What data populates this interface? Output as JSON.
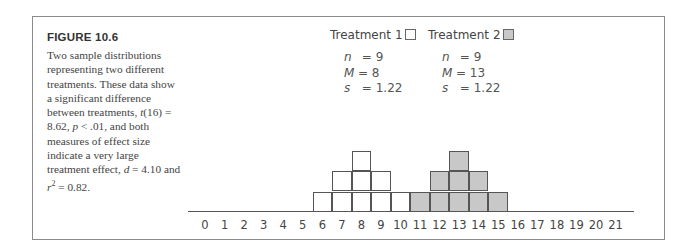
{
  "figure": {
    "title": "FIGURE 10.6",
    "caption_parts": {
      "p1": "Two sample distributions representing two different treatments. These data show a significant difference between treatments, ",
      "t_stat": "t",
      "p2": "(16) = 8.62, ",
      "p_sym": "p",
      "p3": " < .01, and both measures of effect size indicate a very large treatment effect, ",
      "d_sym": "d",
      "p4": " = 4.10 and ",
      "r_sym": "r",
      "r_sup": "2",
      "p5": " = 0.82."
    }
  },
  "legend": {
    "t1": {
      "label": "Treatment 1",
      "fill": "#ffffff"
    },
    "t2": {
      "label": "Treatment 2",
      "fill": "#c8c8c8"
    }
  },
  "stats": {
    "t1": {
      "n_label": "n",
      "n_value": "= 9",
      "m_label": "M",
      "m_value": "= 8",
      "s_label": "s",
      "s_value": "= 1.22"
    },
    "t2": {
      "n_label": "n",
      "n_value": "= 9",
      "m_label": "M",
      "m_value": "= 13",
      "s_label": "s",
      "s_value": "= 1.22"
    }
  },
  "chart_data": {
    "type": "bar",
    "title": "FIGURE 10.6",
    "xlabel": "",
    "ylabel": "",
    "categories": [
      "0",
      "1",
      "2",
      "3",
      "4",
      "5",
      "6",
      "7",
      "8",
      "9",
      "10",
      "11",
      "12",
      "13",
      "14",
      "15",
      "16",
      "17",
      "18",
      "19",
      "20",
      "21"
    ],
    "series": [
      {
        "name": "Treatment 1",
        "fill": "#ffffff",
        "n": 9,
        "M": 8,
        "s": 1.22,
        "values": [
          0,
          0,
          0,
          0,
          0,
          0,
          1,
          2,
          3,
          2,
          1,
          0,
          0,
          0,
          0,
          0,
          0,
          0,
          0,
          0,
          0,
          0
        ]
      },
      {
        "name": "Treatment 2",
        "fill": "#c8c8c8",
        "n": 9,
        "M": 13,
        "s": 1.22,
        "values": [
          0,
          0,
          0,
          0,
          0,
          0,
          0,
          0,
          0,
          0,
          0,
          1,
          2,
          3,
          2,
          1,
          0,
          0,
          0,
          0,
          0,
          0
        ]
      }
    ],
    "xlim": [
      0,
      21
    ],
    "ylim": [
      0,
      3
    ],
    "grid": false,
    "legend_position": "top"
  }
}
